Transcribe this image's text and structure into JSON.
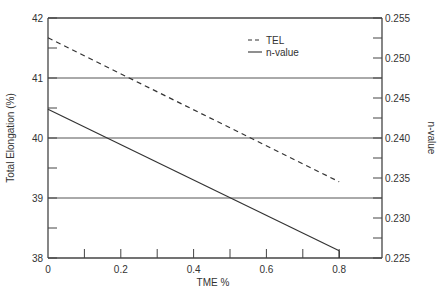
{
  "chart_data": {
    "type": "line",
    "title": "",
    "xlabel": "TME %",
    "ylabel": "Total Elongation (%)",
    "y2label": "n-value",
    "xlim": [
      0,
      0.92
    ],
    "ylim": [
      38,
      42
    ],
    "y2lim": [
      0.225,
      0.255
    ],
    "x_ticks": [
      0,
      0.2,
      0.4,
      0.6,
      0.8
    ],
    "x_tick_labels": [
      "0",
      "0.2",
      "0.4",
      "0.6",
      "0.8"
    ],
    "x_minor_ticks": [
      0.1,
      0.3,
      0.5,
      0.7
    ],
    "y_ticks": [
      38,
      39,
      40,
      41,
      42
    ],
    "y_tick_labels": [
      "38",
      "39",
      "40",
      "41",
      "42"
    ],
    "y_minor_ticks": [
      38.5,
      39.5,
      40.5,
      41.5
    ],
    "y2_ticks": [
      0.225,
      0.23,
      0.235,
      0.24,
      0.245,
      0.25,
      0.255
    ],
    "y2_tick_labels": [
      "0.225",
      "0.230",
      "0.235",
      "0.240",
      "0.245",
      "0.250",
      "0.255"
    ],
    "y2_minor_ticks": [
      0.2275,
      0.2325,
      0.2375,
      0.2425,
      0.2475,
      0.2525
    ],
    "grid": {
      "horizontal": [
        39,
        40,
        41
      ],
      "vertical": false
    },
    "legend": {
      "position": "upper-right-inside",
      "entries": [
        {
          "label": "TEL",
          "style": "dashed"
        },
        {
          "label": "n-value",
          "style": "solid"
        }
      ]
    },
    "series": [
      {
        "name": "TEL",
        "axis": "left",
        "style": "dashed",
        "x": [
          0,
          0.8
        ],
        "values": [
          41.67,
          39.27
        ]
      },
      {
        "name": "n-value",
        "axis": "right",
        "style": "solid",
        "x": [
          0,
          0.8
        ],
        "values": [
          0.2436,
          0.2259
        ]
      }
    ]
  },
  "colors": {
    "axis": "#444444",
    "line": "#333333",
    "grid": "#555555",
    "background": "#ffffff"
  }
}
